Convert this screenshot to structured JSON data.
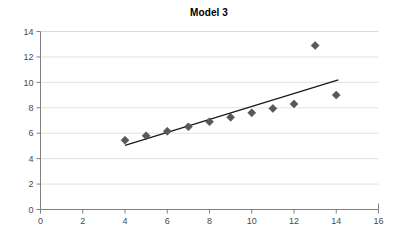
{
  "chart_data": {
    "type": "scatter",
    "title": "Model 3",
    "xlabel": "",
    "ylabel": "",
    "xlim": [
      0,
      16
    ],
    "ylim": [
      0,
      14
    ],
    "xticks": [
      0,
      2,
      4,
      6,
      8,
      10,
      12,
      14,
      16
    ],
    "yticks": [
      0,
      2,
      4,
      6,
      8,
      10,
      12,
      14
    ],
    "grid": "horizontal",
    "legend": "none",
    "series": [
      {
        "name": "observations",
        "marker": "diamond",
        "color": "#595959",
        "x": [
          4,
          5,
          6,
          7,
          8,
          9,
          10,
          11,
          12,
          13,
          14
        ],
        "y": [
          5.45,
          5.8,
          6.15,
          6.5,
          6.9,
          7.25,
          7.6,
          7.95,
          8.3,
          12.9,
          9.0
        ]
      },
      {
        "name": "trendline",
        "marker": "none",
        "color": "#1a1a1a",
        "x": [
          4.0,
          14.1
        ],
        "y": [
          5.05,
          10.2
        ]
      }
    ]
  },
  "axes": {
    "y_tick_labels": [
      "0",
      "2",
      "4",
      "6",
      "8",
      "10",
      "12",
      "14"
    ],
    "x_tick_labels": [
      "0",
      "2",
      "4",
      "6",
      "8",
      "10",
      "12",
      "14",
      "16"
    ]
  },
  "colors": {
    "marker": "#595959",
    "trendline": "#1a1a1a",
    "grid": "#d9d9d9",
    "axis": "#808080",
    "background": "#ffffff",
    "title": "#000000",
    "tick_text": "#4a4a4a"
  }
}
